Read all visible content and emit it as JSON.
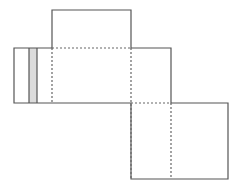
{
  "diagram": {
    "type": "cube-net",
    "colors": {
      "background": "#ffffff",
      "solid_edge": "#555555",
      "fold_line": "#666666",
      "shaded_face": "#dcdcdc"
    },
    "faces": [
      {
        "name": "top-face",
        "x": 52,
        "y": 10,
        "w": 79,
        "h": 38
      },
      {
        "name": "left-end-face",
        "x": 14,
        "y": 48,
        "w": 15,
        "h": 55
      },
      {
        "name": "shaded-face",
        "x": 29,
        "y": 48,
        "w": 8,
        "h": 55,
        "shaded": true
      },
      {
        "name": "narrow-face",
        "x": 37,
        "y": 48,
        "w": 15,
        "h": 55
      },
      {
        "name": "center-face",
        "x": 52,
        "y": 48,
        "w": 79,
        "h": 55
      },
      {
        "name": "right-upper-face",
        "x": 131,
        "y": 48,
        "w": 40,
        "h": 55
      },
      {
        "name": "bottom-left-face",
        "x": 131,
        "y": 103,
        "w": 40,
        "h": 76
      },
      {
        "name": "bottom-right-face",
        "x": 171,
        "y": 103,
        "w": 57,
        "h": 76
      }
    ],
    "fold_lines": [
      {
        "name": "fold-top-center",
        "x1": 52,
        "y1": 48,
        "x2": 131,
        "y2": 48
      },
      {
        "name": "fold-left-center",
        "x1": 52,
        "y1": 48,
        "x2": 52,
        "y2": 103
      },
      {
        "name": "fold-center-right",
        "x1": 131,
        "y1": 48,
        "x2": 131,
        "y2": 179
      },
      {
        "name": "fold-right-bottom",
        "x1": 131,
        "y1": 103,
        "x2": 171,
        "y2": 103
      },
      {
        "name": "fold-bottom-split",
        "x1": 171,
        "y1": 103,
        "x2": 171,
        "y2": 179
      }
    ]
  }
}
